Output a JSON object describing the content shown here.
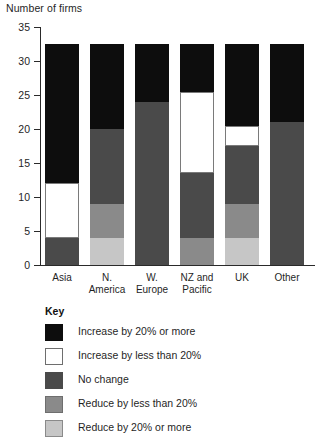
{
  "chart_data": {
    "type": "bar",
    "title": "",
    "ylabel": "Number of firms",
    "xlabel": "",
    "ylim": [
      0,
      35
    ],
    "yticks": [
      0,
      5,
      10,
      15,
      20,
      25,
      30,
      35
    ],
    "grid": false,
    "stacked": true,
    "legend_position": "below",
    "legend_title": "Key",
    "categories": [
      "Asia",
      "N. America",
      "W. Europe",
      "NZ and Pacific",
      "UK",
      "Other"
    ],
    "category_lines": [
      [
        "Asia",
        ""
      ],
      [
        "N.",
        "America"
      ],
      [
        "W.",
        "Europe"
      ],
      [
        "NZ and",
        "Pacific"
      ],
      [
        "UK",
        ""
      ],
      [
        "Other",
        ""
      ]
    ],
    "series": [
      {
        "name": "Reduce by 20% or more",
        "color": "#c6c6c6",
        "values": [
          0,
          4,
          0,
          0,
          4,
          0
        ]
      },
      {
        "name": "Reduce by less than 20%",
        "color": "#8a8a8a",
        "values": [
          0,
          5,
          0,
          4,
          5,
          0
        ]
      },
      {
        "name": "No change",
        "color": "#4a4a4a",
        "values": [
          4,
          11,
          24,
          9.5,
          8.5,
          21
        ]
      },
      {
        "name": "Increase by less than 20%",
        "color": "#ffffff",
        "values": [
          8,
          0,
          0,
          12,
          3,
          0
        ]
      },
      {
        "name": "Increase by 20% or more",
        "color": "#0d0d0d",
        "values": [
          20.5,
          12.5,
          8.5,
          7,
          12,
          11.5
        ]
      }
    ],
    "totals": [
      32.5,
      32.5,
      32.5,
      32.5,
      32.5,
      32.5
    ]
  },
  "legend": {
    "title": "Key",
    "items": [
      {
        "label": "Increase by 20% or more",
        "swatch": "black"
      },
      {
        "label": "Increase by less than 20%",
        "swatch": "white"
      },
      {
        "label": "No change",
        "swatch": "dark"
      },
      {
        "label": "Reduce by less than 20%",
        "swatch": "mid"
      },
      {
        "label": "Reduce by 20% or more",
        "swatch": "light"
      }
    ]
  }
}
